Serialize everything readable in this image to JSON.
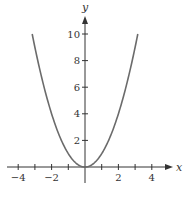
{
  "chart_data": {
    "type": "line",
    "title": "",
    "xlabel": "x",
    "ylabel": "y",
    "function": "y = x^2",
    "xlim": [
      -4.6,
      5.2
    ],
    "ylim": [
      0,
      11.5
    ],
    "x_ticks": [
      -4,
      -3,
      -2,
      -1,
      1,
      2,
      3,
      4
    ],
    "x_tick_labels": [
      "-4",
      "-2",
      "2",
      "4"
    ],
    "x_tick_label_values": [
      -4,
      -2,
      2,
      4
    ],
    "y_ticks": [
      2,
      4,
      6,
      8,
      10
    ],
    "y_tick_labels": [
      "2",
      "4",
      "6",
      "8",
      "10"
    ],
    "grid": false,
    "legend": null,
    "series": [
      {
        "name": "y = x^2",
        "x": [
          -3.16,
          -3,
          -2.5,
          -2,
          -1.5,
          -1,
          -0.5,
          0,
          0.5,
          1,
          1.5,
          2,
          2.5,
          3,
          3.16
        ],
        "y": [
          10,
          9,
          6.25,
          4,
          2.25,
          1,
          0.25,
          0,
          0.25,
          1,
          2.25,
          4,
          6.25,
          9,
          10
        ]
      }
    ]
  },
  "colors": {
    "curve": "#6b6b6b",
    "axis": "#333333",
    "background": "#ffffff"
  }
}
